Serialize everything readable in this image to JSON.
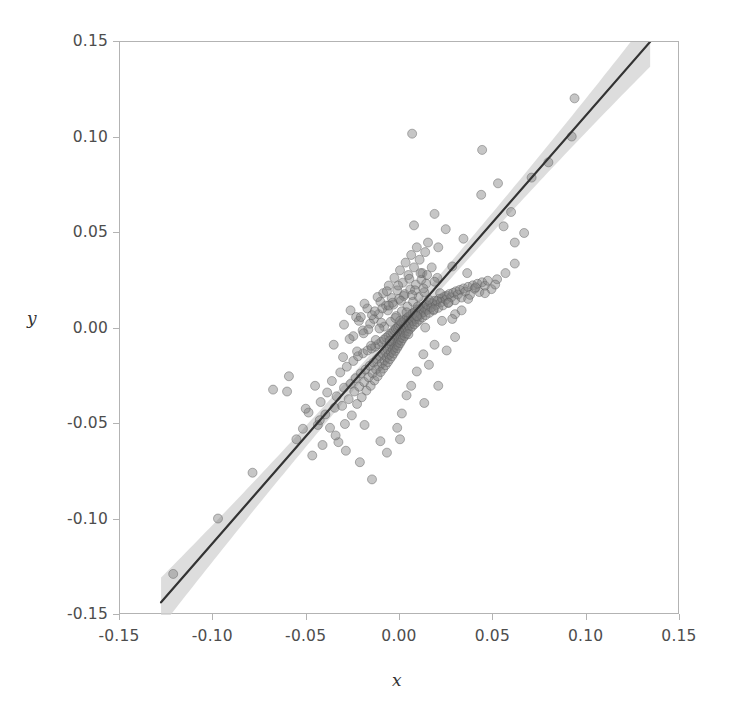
{
  "figure": {
    "width": 734,
    "height": 712,
    "background": "#ffffff",
    "frame_color": "#b3b3b3",
    "tick_label_color": "#4d4d4d"
  },
  "axes": {
    "x_title": "x",
    "y_title": "y",
    "x_ticks": [
      "-0.15",
      "-0.10",
      "-0.05",
      "0.00",
      "0.05",
      "0.10",
      "0.15"
    ],
    "y_ticks": [
      "0.15",
      "0.10",
      "0.05",
      "0.00",
      "-0.05",
      "-0.10",
      "-0.15"
    ]
  },
  "chart_data": {
    "type": "scatter",
    "title": "",
    "xlabel": "x",
    "ylabel": "y",
    "xlim": [
      -0.15,
      0.15
    ],
    "ylim": [
      -0.15,
      0.15
    ],
    "xticks": [
      -0.15,
      -0.1,
      -0.05,
      0,
      0.05,
      0.1,
      0.15
    ],
    "yticks": [
      -0.15,
      -0.1,
      -0.05,
      0,
      0.05,
      0.1,
      0.15
    ],
    "grid": false,
    "legend": "none",
    "marker": {
      "shape": "circle",
      "size_px": 9,
      "fill": "#808080",
      "fill_opacity": 0.45,
      "edge": "#5a5a5a"
    },
    "fit_line": {
      "label": "linear regression fit",
      "color": "#333333",
      "width_px": 2.2,
      "slope": 1.12,
      "intercept": 0.0,
      "x_start": -0.128,
      "x_end": 0.134
    },
    "confidence_band": {
      "label": "confidence interval band",
      "color": "#d2d2d2",
      "opacity": 0.75,
      "half_width_center": 0.004,
      "half_width_edge": 0.013
    },
    "points": [
      [
        -0.1215,
        -0.1285
      ],
      [
        -0.0975,
        -0.0995
      ],
      [
        -0.079,
        -0.0755
      ],
      [
        -0.0605,
        -0.033
      ],
      [
        -0.0555,
        -0.058
      ],
      [
        -0.052,
        -0.0525
      ],
      [
        -0.049,
        -0.044
      ],
      [
        -0.047,
        -0.0665
      ],
      [
        -0.0455,
        -0.03
      ],
      [
        -0.044,
        -0.0505
      ],
      [
        -0.0425,
        -0.0385
      ],
      [
        -0.0415,
        -0.061
      ],
      [
        -0.04,
        -0.045
      ],
      [
        -0.039,
        -0.0335
      ],
      [
        -0.0375,
        -0.052
      ],
      [
        -0.0365,
        -0.0275
      ],
      [
        -0.035,
        -0.0415
      ],
      [
        -0.034,
        -0.0355
      ],
      [
        -0.033,
        -0.0595
      ],
      [
        -0.032,
        -0.023
      ],
      [
        -0.031,
        -0.0405
      ],
      [
        -0.03,
        -0.031
      ],
      [
        -0.0295,
        -0.05
      ],
      [
        -0.0285,
        -0.02
      ],
      [
        -0.0275,
        -0.037
      ],
      [
        -0.0265,
        -0.029
      ],
      [
        -0.0258,
        -0.0455
      ],
      [
        -0.025,
        -0.017
      ],
      [
        -0.0245,
        -0.033
      ],
      [
        -0.0238,
        -0.026
      ],
      [
        -0.023,
        -0.0395
      ],
      [
        -0.0225,
        -0.0145
      ],
      [
        -0.0218,
        -0.0305
      ],
      [
        -0.021,
        -0.0235
      ],
      [
        -0.0205,
        -0.036
      ],
      [
        -0.0198,
        -0.013
      ],
      [
        -0.0192,
        -0.028
      ],
      [
        -0.0185,
        -0.0215
      ],
      [
        -0.018,
        -0.0325
      ],
      [
        -0.0174,
        -0.0115
      ],
      [
        -0.0168,
        -0.0255
      ],
      [
        -0.0162,
        -0.0195
      ],
      [
        -0.0157,
        -0.03
      ],
      [
        -0.0152,
        -0.0105
      ],
      [
        -0.0147,
        -0.0235
      ],
      [
        -0.0142,
        -0.0178
      ],
      [
        -0.0137,
        -0.0272
      ],
      [
        -0.0133,
        -0.0095
      ],
      [
        -0.0128,
        -0.0215
      ],
      [
        -0.0124,
        -0.016
      ],
      [
        -0.012,
        -0.025
      ],
      [
        -0.0116,
        -0.0082
      ],
      [
        -0.0112,
        -0.0198
      ],
      [
        -0.0108,
        -0.0145
      ],
      [
        -0.0104,
        -0.0228
      ],
      [
        -0.01,
        -0.007
      ],
      [
        -0.0097,
        -0.0182
      ],
      [
        -0.0093,
        -0.0132
      ],
      [
        -0.009,
        -0.021
      ],
      [
        -0.0086,
        -0.0058
      ],
      [
        -0.0083,
        -0.0168
      ],
      [
        -0.008,
        -0.012
      ],
      [
        -0.0077,
        -0.0192
      ],
      [
        -0.0074,
        -0.0048
      ],
      [
        -0.0071,
        -0.0152
      ],
      [
        -0.0068,
        -0.0108
      ],
      [
        -0.0065,
        -0.0176
      ],
      [
        -0.0062,
        -0.0038
      ],
      [
        -0.0059,
        -0.0138
      ],
      [
        -0.0056,
        -0.0096
      ],
      [
        -0.0054,
        -0.016
      ],
      [
        -0.0051,
        -0.0028
      ],
      [
        -0.0048,
        -0.0124
      ],
      [
        -0.0046,
        -0.0085
      ],
      [
        -0.0043,
        -0.0145
      ],
      [
        -0.0041,
        -0.0019
      ],
      [
        -0.0038,
        -0.011
      ],
      [
        -0.0036,
        -0.0074
      ],
      [
        -0.0034,
        -0.0131
      ],
      [
        -0.0031,
        -0.001
      ],
      [
        -0.0029,
        -0.0097
      ],
      [
        -0.0027,
        -0.0063
      ],
      [
        -0.0025,
        -0.0117
      ],
      [
        -0.0022,
        -0.0002
      ],
      [
        -0.002,
        -0.0084
      ],
      [
        -0.0018,
        -0.0052
      ],
      [
        -0.0016,
        -0.0103
      ],
      [
        -0.0014,
        0.0006
      ],
      [
        -0.0012,
        -0.0071
      ],
      [
        -0.001,
        -0.0041
      ],
      [
        -0.0008,
        -0.009
      ],
      [
        -0.0006,
        0.0014
      ],
      [
        -0.0004,
        -0.0058
      ],
      [
        -0.0002,
        -0.003
      ],
      [
        0.0,
        -0.0077
      ],
      [
        0.0002,
        0.0022
      ],
      [
        0.0004,
        -0.0046
      ],
      [
        0.0006,
        -0.0019
      ],
      [
        0.0008,
        -0.0064
      ],
      [
        0.001,
        0.003
      ],
      [
        0.0012,
        -0.0034
      ],
      [
        0.0014,
        -0.0008
      ],
      [
        0.0016,
        -0.0051
      ],
      [
        0.0018,
        0.0038
      ],
      [
        0.002,
        -0.0022
      ],
      [
        0.0022,
        0.0003
      ],
      [
        0.0025,
        -0.0039
      ],
      [
        0.0027,
        0.0046
      ],
      [
        0.0029,
        -0.001
      ],
      [
        0.0031,
        0.0014
      ],
      [
        0.0034,
        -0.0026
      ],
      [
        0.0036,
        0.0054
      ],
      [
        0.0038,
        0.0002
      ],
      [
        0.0041,
        0.0025
      ],
      [
        0.0043,
        -0.0014
      ],
      [
        0.0046,
        0.0062
      ],
      [
        0.0048,
        0.0014
      ],
      [
        0.0051,
        0.0036
      ],
      [
        0.0054,
        -0.0002
      ],
      [
        0.0056,
        0.007
      ],
      [
        0.0059,
        0.0026
      ],
      [
        0.0062,
        0.0047
      ],
      [
        0.0065,
        0.001
      ],
      [
        0.0068,
        0.0079
      ],
      [
        0.0071,
        0.0038
      ],
      [
        0.0074,
        0.0058
      ],
      [
        0.0077,
        0.0022
      ],
      [
        0.008,
        0.0087
      ],
      [
        0.0083,
        0.005
      ],
      [
        0.0086,
        0.0069
      ],
      [
        0.009,
        0.0034
      ],
      [
        0.0093,
        0.0096
      ],
      [
        0.0097,
        0.0062
      ],
      [
        0.01,
        0.0081
      ],
      [
        0.0104,
        0.0046
      ],
      [
        0.0108,
        0.0105
      ],
      [
        0.0112,
        0.0074
      ],
      [
        0.0116,
        0.0093
      ],
      [
        0.012,
        0.0058
      ],
      [
        0.0124,
        0.0114
      ],
      [
        0.0128,
        0.0086
      ],
      [
        0.0133,
        0.0105
      ],
      [
        0.0137,
        0.007
      ],
      [
        0.0142,
        0.0124
      ],
      [
        0.0147,
        0.0098
      ],
      [
        0.0152,
        0.0118
      ],
      [
        0.0157,
        0.0082
      ],
      [
        0.0162,
        0.0134
      ],
      [
        0.0168,
        0.011
      ],
      [
        0.0174,
        0.0131
      ],
      [
        0.018,
        0.0095
      ],
      [
        0.0185,
        0.0145
      ],
      [
        0.0192,
        0.0123
      ],
      [
        0.0198,
        0.0144
      ],
      [
        0.0205,
        0.0108
      ],
      [
        0.021,
        0.0156
      ],
      [
        0.0218,
        0.0136
      ],
      [
        0.0225,
        0.0158
      ],
      [
        0.023,
        0.0121
      ],
      [
        0.0238,
        0.0168
      ],
      [
        0.0245,
        0.015
      ],
      [
        0.025,
        0.0172
      ],
      [
        0.0258,
        0.0134
      ],
      [
        0.0265,
        0.0181
      ],
      [
        0.0275,
        0.0164
      ],
      [
        0.0285,
        0.0187
      ],
      [
        0.0295,
        0.0148
      ],
      [
        0.03,
        0.0195
      ],
      [
        0.031,
        0.0178
      ],
      [
        0.032,
        0.0202
      ],
      [
        0.033,
        0.0162
      ],
      [
        0.034,
        0.021
      ],
      [
        0.035,
        0.0193
      ],
      [
        0.0365,
        0.0218
      ],
      [
        0.0375,
        0.0176
      ],
      [
        0.039,
        0.0226
      ],
      [
        0.04,
        0.0208
      ],
      [
        0.0415,
        0.0234
      ],
      [
        0.0425,
        0.0191
      ],
      [
        0.044,
        0.0242
      ],
      [
        0.0455,
        0.0224
      ],
      [
        0.047,
        0.025
      ],
      [
        0.049,
        0.0206
      ],
      [
        0.052,
        0.0258
      ],
      [
        -0.0235,
        0.006
      ],
      [
        -0.0175,
        0.0105
      ],
      [
        -0.014,
        0.005
      ],
      [
        -0.0105,
        0.014
      ],
      [
        -0.009,
        0.0185
      ],
      [
        -0.0075,
        0.012
      ],
      [
        -0.006,
        0.0225
      ],
      [
        -0.0045,
        0.016
      ],
      [
        -0.003,
        0.0265
      ],
      [
        -0.0015,
        0.02
      ],
      [
        0.0,
        0.0305
      ],
      [
        0.0015,
        0.024
      ],
      [
        0.003,
        0.0345
      ],
      [
        0.0045,
        0.028
      ],
      [
        0.006,
        0.0385
      ],
      [
        0.0075,
        0.032
      ],
      [
        0.009,
        0.0425
      ],
      [
        0.0105,
        0.036
      ],
      [
        0.012,
        0.029
      ],
      [
        0.0135,
        0.04
      ],
      [
        -0.02,
        -0.001
      ],
      [
        -0.016,
        0.0025
      ],
      [
        -0.013,
        -0.006
      ],
      [
        -0.0115,
        0.0075
      ],
      [
        -0.0085,
        0.001
      ],
      [
        -0.0065,
        0.0095
      ],
      [
        -0.005,
        0.0035
      ],
      [
        -0.0035,
        0.0125
      ],
      [
        -0.002,
        0.0065
      ],
      [
        -0.0005,
        0.0155
      ],
      [
        0.001,
        0.009
      ],
      [
        0.0025,
        0.018
      ],
      [
        0.004,
        0.0115
      ],
      [
        0.0055,
        0.0205
      ],
      [
        0.007,
        0.014
      ],
      [
        0.0085,
        0.023
      ],
      [
        0.01,
        0.0165
      ],
      [
        0.0115,
        0.0255
      ],
      [
        0.013,
        0.019
      ],
      [
        0.0145,
        0.028
      ],
      [
        -0.0265,
        0.0095
      ],
      [
        -0.022,
        0.004
      ],
      [
        -0.019,
        0.013
      ],
      [
        -0.015,
        0.007
      ],
      [
        -0.012,
        0.0165
      ],
      [
        -0.0095,
        0.0105
      ],
      [
        -0.007,
        0.0195
      ],
      [
        -0.004,
        0.0135
      ],
      [
        -0.001,
        0.0225
      ],
      [
        0.002,
        0.017
      ],
      [
        0.005,
        0.026
      ],
      [
        0.008,
        0.02
      ],
      [
        0.011,
        0.029
      ],
      [
        0.014,
        0.0235
      ],
      [
        0.017,
        0.032
      ],
      [
        0.02,
        0.0265
      ],
      [
        -0.03,
        0.002
      ],
      [
        -0.025,
        -0.004
      ],
      [
        -0.021,
        0.006
      ],
      [
        -0.017,
        -0.0005
      ],
      [
        -0.0135,
        0.009
      ],
      [
        -0.01,
        0.003
      ],
      [
        -0.006,
        0.012
      ],
      [
        -0.0025,
        0.0055
      ],
      [
        0.0005,
        0.0145
      ],
      [
        0.0035,
        0.0085
      ],
      [
        0.0065,
        0.0175
      ],
      [
        0.0095,
        0.0115
      ],
      [
        0.0125,
        0.021
      ],
      [
        0.0155,
        0.015
      ],
      [
        0.0185,
        0.0245
      ],
      [
        0.0215,
        0.0185
      ],
      [
        -0.0355,
        -0.0085
      ],
      [
        -0.0305,
        -0.015
      ],
      [
        -0.027,
        -0.0055
      ],
      [
        -0.023,
        -0.012
      ],
      [
        -0.0195,
        -0.0025
      ],
      [
        -0.0155,
        -0.009
      ],
      [
        -0.011,
        0.0
      ],
      [
        -0.0055,
        -0.0065
      ],
      [
        0.0,
        0.004
      ],
      [
        0.0045,
        -0.003
      ],
      [
        0.009,
        0.0065
      ],
      [
        0.0135,
        0.0005
      ],
      [
        0.018,
        0.01
      ],
      [
        0.0225,
        0.004
      ],
      [
        0.026,
        0.0135
      ],
      [
        0.0295,
        0.0075
      ],
      [
        0.0065,
        0.102
      ],
      [
        0.044,
        0.0935
      ],
      [
        0.0435,
        0.07
      ],
      [
        0.0555,
        0.0535
      ],
      [
        0.0615,
        0.045
      ],
      [
        0.0525,
        0.076
      ],
      [
        0.0595,
        0.061
      ],
      [
        0.0665,
        0.05
      ],
      [
        0.092,
        0.1005
      ],
      [
        0.0935,
        0.1205
      ],
      [
        0.0705,
        0.079
      ],
      [
        0.0795,
        0.087
      ],
      [
        0.0245,
        0.052
      ],
      [
        0.0205,
        0.0425
      ],
      [
        0.034,
        0.047
      ],
      [
        0.015,
        0.045
      ],
      [
        0.0075,
        0.054
      ],
      [
        0.0185,
        0.06
      ],
      [
        0.028,
        0.0325
      ],
      [
        0.036,
        0.029
      ],
      [
        0.0125,
        -0.0135
      ],
      [
        0.0185,
        -0.0085
      ],
      [
        0.025,
        -0.0115
      ],
      [
        0.0155,
        -0.019
      ],
      [
        0.0295,
        -0.0045
      ],
      [
        0.009,
        -0.0225
      ],
      [
        0.006,
        -0.03
      ],
      [
        0.0035,
        -0.035
      ],
      [
        0.001,
        -0.0445
      ],
      [
        -0.0015,
        -0.052
      ],
      [
        0.013,
        -0.039
      ],
      [
        0.0205,
        -0.03
      ],
      [
        -0.0595,
        -0.025
      ],
      [
        -0.068,
        -0.032
      ],
      [
        -0.0505,
        -0.042
      ],
      [
        -0.043,
        -0.048
      ],
      [
        -0.0345,
        -0.056
      ],
      [
        -0.029,
        -0.064
      ],
      [
        -0.0215,
        -0.07
      ],
      [
        -0.015,
        -0.079
      ],
      [
        -0.007,
        -0.065
      ],
      [
        0.0,
        -0.058
      ],
      [
        -0.0105,
        -0.059
      ],
      [
        -0.019,
        -0.0505
      ],
      [
        0.0455,
        0.0185
      ],
      [
        0.051,
        0.023
      ],
      [
        0.0565,
        0.029
      ],
      [
        0.0615,
        0.034
      ],
      [
        0.0365,
        0.0155
      ],
      [
        0.0405,
        0.0215
      ],
      [
        0.033,
        0.0095
      ],
      [
        0.028,
        0.005
      ]
    ]
  }
}
